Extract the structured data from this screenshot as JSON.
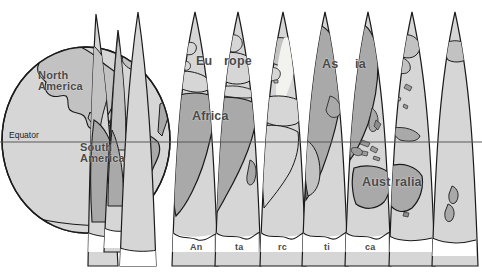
{
  "figure": {
    "type": "globe-gore-projection-diagram",
    "width": 482,
    "height": 272,
    "background": "#ffffff"
  },
  "colors": {
    "background": "#ffffff",
    "ocean_fill": "#d6d6d6",
    "land_fill": "#a9a9a9",
    "land_fill_light": "#c2c2c2",
    "outline": "#1a1a1a",
    "label_text": "#4a4a4a",
    "equator_line": "#58595b",
    "equator_text": "#1d1d1d",
    "highlight_patch": "#f2f2ee"
  },
  "equator": {
    "label": "Equator",
    "y": 142,
    "label_x": 9,
    "label_y": 130
  },
  "labels": [
    {
      "name": "north-america",
      "text": "North\nAmerica",
      "x": 38,
      "y": 70,
      "size": "mid"
    },
    {
      "name": "south-america",
      "text": "South\nAmerica",
      "x": 80,
      "y": 142,
      "size": "mid"
    },
    {
      "name": "europe-part-1",
      "text": "Eu",
      "x": 196,
      "y": 55,
      "size": "big"
    },
    {
      "name": "europe-part-2",
      "text": "rope",
      "x": 224,
      "y": 55,
      "size": "big"
    },
    {
      "name": "africa",
      "text": "Africa",
      "x": 192,
      "y": 110,
      "size": "big"
    },
    {
      "name": "asia-part-1",
      "text": "As",
      "x": 322,
      "y": 58,
      "size": "big"
    },
    {
      "name": "asia-part-2",
      "text": "ia",
      "x": 355,
      "y": 58,
      "size": "big"
    },
    {
      "name": "australia-part-1",
      "text": "Aust",
      "x": 362,
      "y": 176,
      "size": "big"
    },
    {
      "name": "australia-part-2",
      "text": "ralia",
      "x": 395,
      "y": 176,
      "size": "big"
    },
    {
      "name": "antarctica-part-1",
      "text": "An",
      "x": 190,
      "y": 243,
      "size": "sm"
    },
    {
      "name": "antarctica-part-2",
      "text": "ta",
      "x": 235,
      "y": 243,
      "size": "sm"
    },
    {
      "name": "antarctica-part-3",
      "text": "rc",
      "x": 278,
      "y": 243,
      "size": "sm"
    },
    {
      "name": "antarctica-part-4",
      "text": "ti",
      "x": 324,
      "y": 243,
      "size": "sm"
    },
    {
      "name": "antarctica-part-5",
      "text": "ca",
      "x": 365,
      "y": 243,
      "size": "sm"
    }
  ],
  "globe": {
    "cx": 86,
    "cy": 140,
    "rx": 84,
    "ry": 93
  },
  "gores": {
    "count": 9,
    "tip_y": 12,
    "bottom_y": 266,
    "tips_x": [
      138,
      195,
      238,
      283,
      325,
      368,
      412,
      455
    ],
    "half_width": 21
  }
}
